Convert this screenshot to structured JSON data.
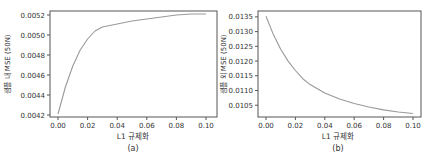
{
  "chart_data": [
    {
      "type": "line",
      "panel_label": "(a)",
      "title": "",
      "xlabel": "L1 규제화",
      "ylabel": "샘플 내 MSE (50N)",
      "xlim": [
        0.0,
        0.1
      ],
      "ylim": [
        0.00418,
        0.00524
      ],
      "x_ticks": [
        "0.00",
        "0.02",
        "0.04",
        "0.06",
        "0.08",
        "0.10"
      ],
      "y_ticks": [
        "0.0042",
        "0.0044",
        "0.0046",
        "0.0048",
        "0.0050",
        "0.0052"
      ],
      "grid": false,
      "legend": null,
      "series": [
        {
          "name": "in-sample MSE",
          "color": "#999999",
          "x": [
            0.0,
            0.005,
            0.01,
            0.015,
            0.02,
            0.025,
            0.03,
            0.04,
            0.05,
            0.06,
            0.07,
            0.08,
            0.09,
            0.1
          ],
          "y": [
            0.00421,
            0.00448,
            0.00469,
            0.00485,
            0.00496,
            0.00504,
            0.00508,
            0.00511,
            0.00514,
            0.00516,
            0.00518,
            0.0052,
            0.00521,
            0.00521
          ]
        }
      ]
    },
    {
      "type": "line",
      "panel_label": "(b)",
      "title": "",
      "xlabel": "L1 규제화",
      "ylabel": "샘플 외 MSE (50N)",
      "xlim": [
        0.0,
        0.1
      ],
      "ylim": [
        0.0101,
        0.0137
      ],
      "x_ticks": [
        "0.00",
        "0.02",
        "0.04",
        "0.06",
        "0.08",
        "0.10"
      ],
      "y_ticks": [
        "0.0105",
        "0.0110",
        "0.0115",
        "0.0120",
        "0.0125",
        "0.0130",
        "0.0135"
      ],
      "grid": false,
      "legend": null,
      "series": [
        {
          "name": "out-of-sample MSE",
          "color": "#999999",
          "x": [
            0.0,
            0.005,
            0.01,
            0.015,
            0.02,
            0.025,
            0.03,
            0.04,
            0.05,
            0.06,
            0.07,
            0.08,
            0.09,
            0.1
          ],
          "y": [
            0.01352,
            0.0129,
            0.0124,
            0.012,
            0.01168,
            0.0114,
            0.0112,
            0.01092,
            0.01071,
            0.01056,
            0.01044,
            0.01034,
            0.01027,
            0.01022
          ]
        }
      ]
    }
  ]
}
